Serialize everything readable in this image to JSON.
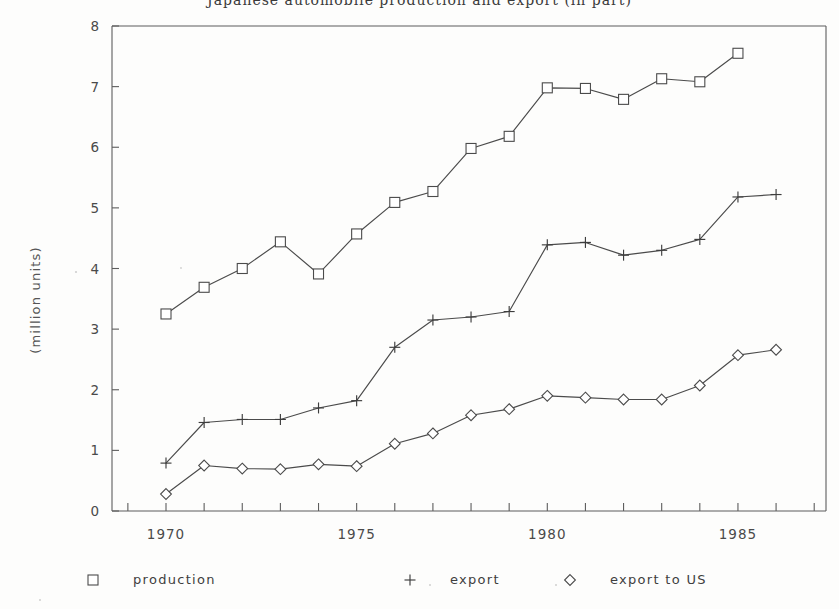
{
  "chart_data": {
    "type": "line",
    "title": "Japanese automobile production and export (in part)",
    "xlabel": "",
    "ylabel": "(million units)",
    "xlim": [
      1969,
      1987
    ],
    "ylim": [
      0,
      8
    ],
    "ytick_labels": [
      "0",
      "1",
      "2",
      "3",
      "4",
      "5",
      "6",
      "7",
      "8"
    ],
    "ytick_values": [
      0,
      1,
      2,
      3,
      4,
      5,
      6,
      7,
      8
    ],
    "xtick_labels": [
      "1970",
      "1975",
      "1980",
      "1985"
    ],
    "xtick_values": [
      1970,
      1975,
      1980,
      1985
    ],
    "x_minor_ticks": [
      1969,
      1970,
      1971,
      1972,
      1973,
      1974,
      1975,
      1976,
      1977,
      1978,
      1979,
      1980,
      1981,
      1982,
      1983,
      1984,
      1985,
      1986,
      1987
    ],
    "grid": false,
    "legend_position": "below",
    "x": [
      1970,
      1971,
      1972,
      1973,
      1974,
      1975,
      1976,
      1977,
      1978,
      1979,
      1980,
      1981,
      1982,
      1983,
      1984,
      1985,
      1986
    ],
    "series": [
      {
        "name": "production",
        "marker": "square",
        "x": [
          1970,
          1971,
          1972,
          1973,
          1974,
          1975,
          1976,
          1977,
          1978,
          1979,
          1980,
          1981,
          1982,
          1983,
          1984,
          1985
        ],
        "values": [
          3.25,
          3.69,
          4.0,
          4.44,
          3.91,
          4.57,
          5.09,
          5.27,
          5.98,
          6.18,
          6.98,
          6.97,
          6.79,
          7.13,
          7.08,
          7.55
        ]
      },
      {
        "name": "export",
        "marker": "plus",
        "x": [
          1970,
          1971,
          1972,
          1973,
          1974,
          1975,
          1976,
          1977,
          1978,
          1979,
          1980,
          1981,
          1982,
          1983,
          1984,
          1985,
          1986
        ],
        "values": [
          0.79,
          1.46,
          1.51,
          1.51,
          1.7,
          1.82,
          2.7,
          3.15,
          3.2,
          3.29,
          4.39,
          4.43,
          4.22,
          4.3,
          4.48,
          5.18,
          5.22
        ]
      },
      {
        "name": "export to US",
        "marker": "diamond",
        "x": [
          1970,
          1971,
          1972,
          1973,
          1974,
          1975,
          1976,
          1977,
          1978,
          1979,
          1980,
          1981,
          1982,
          1983,
          1984,
          1985,
          1986
        ],
        "values": [
          0.28,
          0.75,
          0.7,
          0.69,
          0.77,
          0.74,
          1.11,
          1.28,
          1.58,
          1.68,
          1.9,
          1.87,
          1.84,
          1.84,
          2.07,
          2.57,
          2.66
        ]
      }
    ]
  },
  "legend": {
    "items": [
      {
        "label": "production",
        "marker": "square"
      },
      {
        "label": "export",
        "marker": "plus"
      },
      {
        "label": "export to US",
        "marker": "diamond"
      }
    ]
  }
}
